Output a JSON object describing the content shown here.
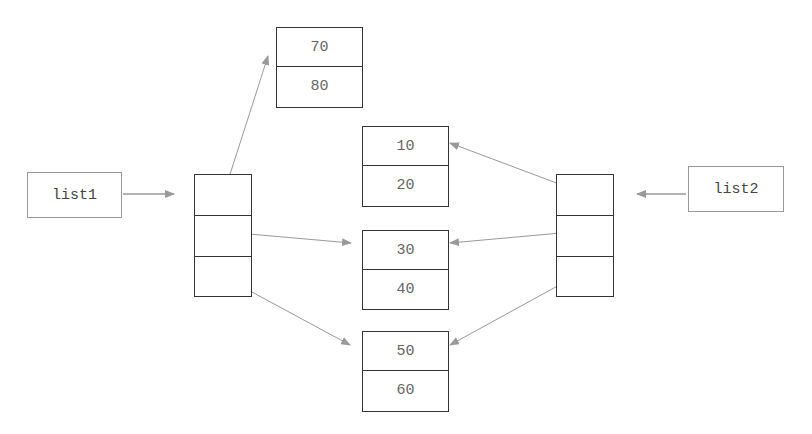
{
  "labels": {
    "list1": "list1",
    "list2": "list2"
  },
  "nodes": [
    {
      "id": "n1",
      "values": [
        "70",
        "80"
      ]
    },
    {
      "id": "n2",
      "values": [
        "10",
        "20"
      ]
    },
    {
      "id": "n3",
      "values": [
        "30",
        "40"
      ]
    },
    {
      "id": "n4",
      "values": [
        "50",
        "60"
      ]
    }
  ],
  "arrays": {
    "left_cells": 3,
    "right_cells": 3
  },
  "colors": {
    "arrow": "#999999",
    "border": "#333333",
    "text": "#666666"
  }
}
